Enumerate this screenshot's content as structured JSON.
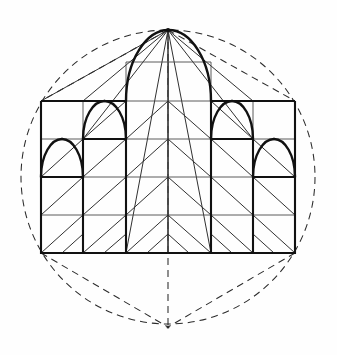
{
  "figure": {
    "description": "Elevation of a gothic west front inscribed within a circle, with dashed circle and hexagon construction lines, a square grid, diagonal lattice and pointed (lancet) arches.",
    "medium": "line drawing"
  },
  "canvas": {
    "width": 337,
    "height": 355,
    "background": "#ffffff"
  },
  "colors": {
    "ink": "#111111",
    "grid": "#3a3a3a",
    "construction": "#2b2b2b",
    "paper": "#ffffff"
  },
  "chart_data": {
    "type": "diagram",
    "xlabel": "",
    "ylabel": "",
    "circle": {
      "cx": 168,
      "cy": 177,
      "r": 147,
      "style": "dashed"
    },
    "apex": {
      "x": 168,
      "y": 30
    },
    "base_vertex": {
      "x": 168,
      "y": 327
    },
    "facade": {
      "left": 41,
      "right": 295,
      "top": 101,
      "bottom": 253,
      "columns": [
        41,
        83,
        126,
        168,
        211,
        253,
        295
      ],
      "rows": [
        101,
        139,
        177,
        215,
        253
      ]
    },
    "tower": {
      "left": 126,
      "right": 211,
      "top": 62,
      "bottom": 101
    },
    "hexagon_points": [
      [
        168,
        30
      ],
      [
        295,
        101
      ],
      [
        295,
        253
      ],
      [
        168,
        327
      ],
      [
        41,
        253
      ],
      [
        41,
        101
      ]
    ],
    "arches": [
      {
        "name": "central-lancet",
        "left": 126,
        "right": 211,
        "springline": 101,
        "apex_y": 30,
        "weight": "heavy"
      },
      {
        "name": "inner-left-lancet",
        "left": 83,
        "right": 126,
        "springline": 139,
        "apex_y": 101,
        "weight": "heavy"
      },
      {
        "name": "inner-right-lancet",
        "left": 211,
        "right": 253,
        "springline": 139,
        "apex_y": 101,
        "weight": "heavy"
      },
      {
        "name": "outer-left-lancet",
        "left": 41,
        "right": 83,
        "springline": 177,
        "apex_y": 139,
        "weight": "heavy"
      },
      {
        "name": "outer-right-lancet",
        "left": 253,
        "right": 295,
        "springline": 177,
        "apex_y": 139,
        "weight": "heavy"
      }
    ],
    "rays_from_apex": [
      [
        41,
        101
      ],
      [
        83,
        101
      ],
      [
        83,
        139
      ],
      [
        126,
        253
      ],
      [
        168,
        253
      ],
      [
        211,
        253
      ],
      [
        253,
        139
      ],
      [
        253,
        101
      ],
      [
        295,
        101
      ]
    ],
    "legend": [],
    "grid": "on",
    "annotations": []
  }
}
